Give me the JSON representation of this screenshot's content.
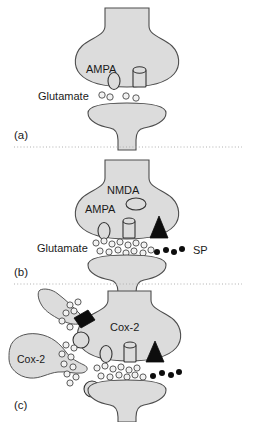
{
  "figure": {
    "background": "#ffffff",
    "cell_fill": "#dcdcdc",
    "cell_stroke": "#4d4d4d",
    "sp_color": "#0d0d0d",
    "separator_color": "#b0b0b0"
  },
  "panels": [
    {
      "id": "a",
      "label": "(a)",
      "labels": {
        "ampa": "AMPA",
        "glutamate": "Glutamate"
      },
      "elements": {
        "presynaptic_terminal": "presynaptic-terminal",
        "postsynaptic_terminal": "postsynaptic-terminal",
        "ampa_receptor": "ampa-receptor-ellipse",
        "nmda_channel": "nmda-channel-cylinder",
        "glutamate_vesicles": 4
      }
    },
    {
      "id": "b",
      "label": "(b)",
      "labels": {
        "nmda": "NMDA",
        "ampa": "AMPA",
        "glutamate": "Glutamate",
        "sp": "SP"
      },
      "elements": {
        "presynaptic_terminal": "presynaptic-terminal",
        "postsynaptic_terminal": "postsynaptic-terminal",
        "ampa_receptor": "ampa-receptor-ellipse",
        "nmda_receptor": "nmda-receptor-ellipse",
        "channel": "channel-cylinder",
        "nk1_receptor": "nk1-receptor-triangle",
        "glutamate_vesicles": 14,
        "sp_particles": 4
      }
    },
    {
      "id": "c",
      "label": "(c)",
      "labels": {
        "cox2_neuron": "Cox-2",
        "cox2_glia": "Cox-2"
      },
      "elements": {
        "presynaptic_terminal": "presynaptic-terminal",
        "postsynaptic_terminal": "postsynaptic-terminal",
        "glial_process_upper": "glial-process-upper",
        "glial_cell_left": "glial-cell-left",
        "ampa_receptor": "ampa-receptor-ellipse",
        "channel": "channel-cylinder",
        "nk1_receptor": "nk1-receptor-triangle",
        "dark_rhombus": "activated-receptor-rhombus",
        "circle_receptors": 3,
        "glutamate_vesicles": 28,
        "sp_particles": 4
      }
    }
  ]
}
